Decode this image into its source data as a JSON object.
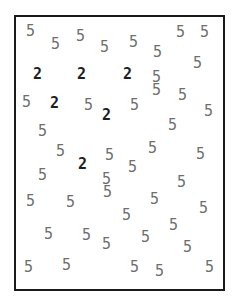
{
  "stimulus": {
    "type": "visual-search",
    "frame_color": "#1a1a1a",
    "target_char": "2",
    "distractor_char": "5",
    "glyphs": [
      {
        "c": "5",
        "x": 26,
        "y": 24,
        "t": 0
      },
      {
        "c": "5",
        "x": 51,
        "y": 37,
        "t": 0
      },
      {
        "c": "5",
        "x": 76,
        "y": 29,
        "t": 0
      },
      {
        "c": "5",
        "x": 100,
        "y": 40,
        "t": 0
      },
      {
        "c": "5",
        "x": 129,
        "y": 35,
        "t": 0
      },
      {
        "c": "5",
        "x": 153,
        "y": 45,
        "t": 0
      },
      {
        "c": "5",
        "x": 176,
        "y": 25,
        "t": 0
      },
      {
        "c": "5",
        "x": 200,
        "y": 25,
        "t": 0
      },
      {
        "c": "5",
        "x": 193,
        "y": 56,
        "t": 0
      },
      {
        "c": "2",
        "x": 33,
        "y": 67,
        "t": 1
      },
      {
        "c": "2",
        "x": 77,
        "y": 67,
        "t": 1
      },
      {
        "c": "2",
        "x": 123,
        "y": 67,
        "t": 1
      },
      {
        "c": "5",
        "x": 152,
        "y": 70,
        "t": 0
      },
      {
        "c": "5",
        "x": 22,
        "y": 95,
        "t": 0
      },
      {
        "c": "2",
        "x": 50,
        "y": 96,
        "t": 1
      },
      {
        "c": "5",
        "x": 84,
        "y": 98,
        "t": 0
      },
      {
        "c": "2",
        "x": 102,
        "y": 108,
        "t": 1
      },
      {
        "c": "5",
        "x": 130,
        "y": 98,
        "t": 0
      },
      {
        "c": "5",
        "x": 152,
        "y": 83,
        "t": 0
      },
      {
        "c": "5",
        "x": 178,
        "y": 88,
        "t": 0
      },
      {
        "c": "5",
        "x": 204,
        "y": 104,
        "t": 0
      },
      {
        "c": "5",
        "x": 38,
        "y": 124,
        "t": 0
      },
      {
        "c": "5",
        "x": 168,
        "y": 118,
        "t": 0
      },
      {
        "c": "5",
        "x": 56,
        "y": 144,
        "t": 0
      },
      {
        "c": "2",
        "x": 78,
        "y": 157,
        "t": 1
      },
      {
        "c": "5",
        "x": 105,
        "y": 148,
        "t": 0
      },
      {
        "c": "5",
        "x": 148,
        "y": 141,
        "t": 0
      },
      {
        "c": "5",
        "x": 196,
        "y": 147,
        "t": 0
      },
      {
        "c": "5",
        "x": 38,
        "y": 168,
        "t": 0
      },
      {
        "c": "5",
        "x": 102,
        "y": 172,
        "t": 0
      },
      {
        "c": "5",
        "x": 128,
        "y": 160,
        "t": 0
      },
      {
        "c": "5",
        "x": 177,
        "y": 175,
        "t": 0
      },
      {
        "c": "5",
        "x": 26,
        "y": 194,
        "t": 0
      },
      {
        "c": "5",
        "x": 66,
        "y": 195,
        "t": 0
      },
      {
        "c": "5",
        "x": 103,
        "y": 185,
        "t": 0
      },
      {
        "c": "5",
        "x": 122,
        "y": 208,
        "t": 0
      },
      {
        "c": "5",
        "x": 150,
        "y": 192,
        "t": 0
      },
      {
        "c": "5",
        "x": 199,
        "y": 201,
        "t": 0
      },
      {
        "c": "5",
        "x": 44,
        "y": 227,
        "t": 0
      },
      {
        "c": "5",
        "x": 82,
        "y": 228,
        "t": 0
      },
      {
        "c": "5",
        "x": 102,
        "y": 237,
        "t": 0
      },
      {
        "c": "5",
        "x": 141,
        "y": 230,
        "t": 0
      },
      {
        "c": "5",
        "x": 169,
        "y": 218,
        "t": 0
      },
      {
        "c": "5",
        "x": 183,
        "y": 240,
        "t": 0
      },
      {
        "c": "5",
        "x": 24,
        "y": 260,
        "t": 0
      },
      {
        "c": "5",
        "x": 62,
        "y": 258,
        "t": 0
      },
      {
        "c": "5",
        "x": 130,
        "y": 260,
        "t": 0
      },
      {
        "c": "5",
        "x": 155,
        "y": 264,
        "t": 0
      },
      {
        "c": "5",
        "x": 205,
        "y": 260,
        "t": 0
      }
    ]
  }
}
